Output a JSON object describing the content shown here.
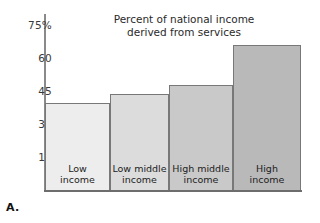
{
  "figure": {
    "panel_label": "A."
  },
  "chart_data": {
    "type": "bar",
    "title": "Percent of national income derived from services",
    "title_line1": "Percent of national income",
    "title_line2": "derived from services",
    "xlabel": "",
    "ylabel": "",
    "categories": [
      "Low income",
      "Low middle income",
      "High middle income",
      "High income"
    ],
    "category_lines": [
      [
        "Low",
        "income"
      ],
      [
        "Low middle",
        "income"
      ],
      [
        "High middle",
        "income"
      ],
      [
        "High",
        "income"
      ]
    ],
    "values": [
      40,
      44,
      48,
      66
    ],
    "ylim": [
      0,
      80
    ],
    "yticks": [
      15,
      30,
      45,
      60,
      75
    ],
    "ytick_labels": [
      "15",
      "30",
      "45",
      "60",
      "75%"
    ],
    "grid": false,
    "legend": "none",
    "bar_colors": [
      "#ededed",
      "#dcdcdc",
      "#c9c9c9",
      "#b9b9b9"
    ],
    "bar_border_color": "#787878",
    "axis_color": "#6d6d6d"
  }
}
